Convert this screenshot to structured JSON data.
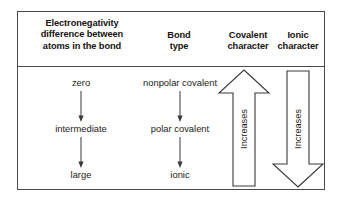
{
  "figure": {
    "columns": [
      {
        "id": "electronegativity",
        "header": "Electronegativity difference between atoms in the bond"
      },
      {
        "id": "bond_type",
        "header": "Bond type"
      },
      {
        "id": "covalent_character",
        "header": "Covalent character"
      },
      {
        "id": "ionic_character",
        "header": "Ionic character"
      }
    ],
    "header_lines": {
      "electronegativity": [
        "Electronegativity",
        "difference between",
        "atoms in the bond"
      ],
      "bond_type": [
        "Bond",
        "type"
      ],
      "covalent_character": [
        "Covalent",
        "character"
      ],
      "ionic_character": [
        "Ionic",
        "character"
      ]
    },
    "rows": [
      {
        "electronegativity": "zero",
        "bond_type": "nonpolar covalent"
      },
      {
        "electronegativity": "intermediate",
        "bond_type": "polar covalent"
      },
      {
        "electronegativity": "large",
        "bond_type": "ionic"
      }
    ],
    "trend_arrows": [
      {
        "id": "covalent",
        "label": "Increases",
        "direction": "up"
      },
      {
        "id": "ionic",
        "label": "Increases",
        "direction": "down"
      }
    ],
    "colors": {
      "border": "#4a4a4a",
      "text": "#1d1a17",
      "header_text": "#16120f",
      "arrow_stroke": "#3a3a3a",
      "background": "#ffffff"
    }
  }
}
